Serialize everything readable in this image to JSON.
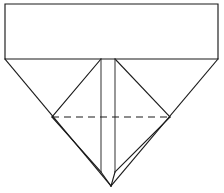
{
  "figure": {
    "background_color": "#ffffff",
    "line_color": "#1a1a1a",
    "line_color_soft": "#3a3a3a",
    "canvas": {
      "width": 224,
      "height": 193
    },
    "geometry": {
      "rectangle": {
        "name": "top-rectangle",
        "left": 5,
        "top": 4,
        "right": 218,
        "bottom": 59,
        "points": "5,4 218,4 218,59 5,59"
      },
      "outer_triangle": {
        "name": "inverted-outer-triangle",
        "left_vertex": {
          "x": 5,
          "y": 59
        },
        "right_vertex": {
          "x": 218,
          "y": 59
        },
        "apex": {
          "x": 111,
          "y": 186
        },
        "points": "5,59 218,59 111,186"
      },
      "vertical_crease_left": {
        "name": "left-vertical-crease",
        "x": 101,
        "y_top": 59,
        "y_bottom": 172
      },
      "vertical_crease_right": {
        "name": "right-vertical-crease",
        "x": 115,
        "y_top": 59,
        "y_bottom": 172
      },
      "node_left": {
        "x": 52,
        "y": 117
      },
      "node_right": {
        "x": 170,
        "y": 117
      },
      "inner_diagonal_upper_left": {
        "from": "101,59",
        "to": "52,117"
      },
      "inner_diagonal_upper_right": {
        "from": "115,59",
        "to": "170,117"
      },
      "inner_diagonal_lower_left": {
        "from": "52,117",
        "to": "101,172"
      },
      "inner_diagonal_lower_right": {
        "from": "170,117",
        "to": "115,172"
      },
      "dashed_crease": {
        "name": "horizontal-dashed-crease",
        "from": {
          "x": 52,
          "y": 117
        },
        "to": {
          "x": 170,
          "y": 117
        },
        "style": "dashed"
      },
      "apex_leg_left": {
        "from": "101,172",
        "to": "111,186"
      },
      "apex_leg_right": {
        "from": "115,172",
        "to": "111,186"
      }
    }
  }
}
